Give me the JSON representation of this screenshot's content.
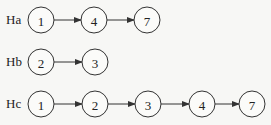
{
  "diagram": {
    "rows": [
      {
        "label": "Ha",
        "y": 20,
        "nodes": [
          {
            "value": "1",
            "x": 41
          },
          {
            "value": "4",
            "x": 94
          },
          {
            "value": "7",
            "x": 147
          }
        ]
      },
      {
        "label": "Hb",
        "y": 62,
        "nodes": [
          {
            "value": "2",
            "x": 41
          },
          {
            "value": "3",
            "x": 95
          }
        ]
      },
      {
        "label": "Hc",
        "y": 104,
        "nodes": [
          {
            "value": "1",
            "x": 41
          },
          {
            "value": "2",
            "x": 95
          },
          {
            "value": "3",
            "x": 148
          },
          {
            "value": "4",
            "x": 202
          },
          {
            "value": "7",
            "x": 252
          }
        ]
      }
    ],
    "node_radius": 13,
    "colors": {
      "stroke": "#333333",
      "background": "#f7f7f5",
      "text": "#222222"
    }
  }
}
